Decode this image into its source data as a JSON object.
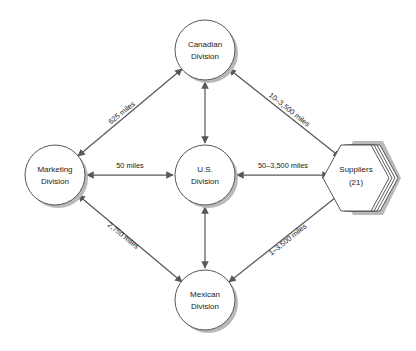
{
  "diagram": {
    "type": "node-link-diagram",
    "background_color": "#ffffff",
    "line_color": "#58585a",
    "text_color": "#1a1a1a",
    "shadow_color": "#b9b9bb",
    "nodes": [
      {
        "id": "canadian",
        "shape": "circle",
        "line1": "Canadian",
        "line2": "Division",
        "cx": 205,
        "cy": 50,
        "r": 30
      },
      {
        "id": "marketing",
        "shape": "circle",
        "line1": "Marketing",
        "line2": "Division",
        "cx": 55,
        "cy": 175,
        "r": 30
      },
      {
        "id": "us",
        "shape": "circle",
        "line1": "U.S.",
        "line2": "Division",
        "cx": 205,
        "cy": 175,
        "r": 30
      },
      {
        "id": "mexican",
        "shape": "circle",
        "line1": "Mexican",
        "line2": "Division",
        "cx": 205,
        "cy": 300,
        "r": 30
      },
      {
        "id": "suppliers",
        "shape": "hexagon-stack",
        "line1": "Suppliers",
        "line2": "(21)",
        "cx": 362,
        "cy": 175,
        "r": 32,
        "stack_count": 3
      }
    ],
    "edges": [
      {
        "id": "marketing-canadian",
        "from": "marketing",
        "to": "canadian",
        "label": "625 miles",
        "arrows": "both",
        "label_x": 122,
        "label_y": 113,
        "label_rotate": -39
      },
      {
        "id": "canadian-suppliers",
        "from": "canadian",
        "to": "suppliers",
        "label": "10–3,500 miles",
        "arrows": "both",
        "label_x": 289,
        "label_y": 113,
        "label_rotate": 39
      },
      {
        "id": "marketing-us",
        "from": "marketing",
        "to": "us",
        "label": "50 miles",
        "arrows": "both",
        "label_x": 130,
        "label_y": 168,
        "label_rotate": 0
      },
      {
        "id": "us-suppliers",
        "from": "us",
        "to": "suppliers",
        "label": "50–3,500 miles",
        "arrows": "both",
        "label_x": 283,
        "label_y": 168,
        "label_rotate": 0
      },
      {
        "id": "canadian-us",
        "from": "canadian",
        "to": "us",
        "label": "",
        "arrows": "both",
        "label_x": 0,
        "label_y": 0,
        "label_rotate": 0
      },
      {
        "id": "us-mexican",
        "from": "us",
        "to": "mexican",
        "label": "",
        "arrows": "both",
        "label_x": 0,
        "label_y": 0,
        "label_rotate": 0
      },
      {
        "id": "marketing-mexican",
        "from": "marketing",
        "to": "mexican",
        "label": "2,750 miles",
        "arrows": "both",
        "label_x": 123,
        "label_y": 239,
        "label_rotate": 39
      },
      {
        "id": "mexican-suppliers",
        "from": "mexican",
        "to": "suppliers",
        "label": "1–3,500 miles",
        "arrows": "both",
        "label_x": 288,
        "label_y": 239,
        "label_rotate": -39
      }
    ]
  }
}
